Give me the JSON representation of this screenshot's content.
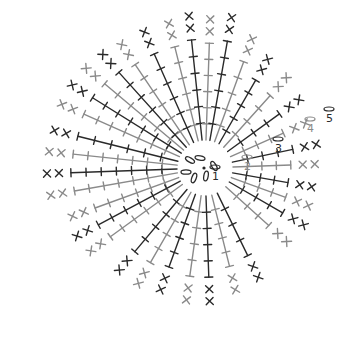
{
  "diagram": {
    "type": "crochet-chart",
    "colors": {
      "dark": "#2a2a2a",
      "light": "#8a8a8a",
      "background": "#ffffff"
    },
    "center": [
      205,
      168
    ],
    "round_labels": [
      {
        "text": "1",
        "x": 212,
        "y": 180,
        "color": "#2a2a2a"
      },
      {
        "text": "2",
        "x": 244,
        "y": 170,
        "color": "#8a8a8a"
      },
      {
        "text": "3",
        "x": 275,
        "y": 152,
        "color": "#2a2a2a"
      },
      {
        "text": "4",
        "x": 307,
        "y": 132,
        "color": "#8a8a8a"
      },
      {
        "text": "5",
        "x": 326,
        "y": 122,
        "color": "#2a2a2a"
      }
    ],
    "legend_symbols": [
      "chain-oval",
      "slip-stitch-dot",
      "single-crochet-cross",
      "double-crochet-T",
      "v-stitch"
    ],
    "spokes": [
      {
        "angle": 200,
        "len": 150,
        "tone": "light"
      },
      {
        "angle": 208,
        "len": 155,
        "tone": "dark"
      },
      {
        "angle": 216,
        "len": 150,
        "tone": "light"
      },
      {
        "angle": 190,
        "len": 170,
        "tone": "light"
      },
      {
        "angle": 182,
        "len": 172,
        "tone": "dark"
      },
      {
        "angle": 174,
        "len": 170,
        "tone": "light"
      },
      {
        "angle": 166,
        "len": 168,
        "tone": "dark"
      },
      {
        "angle": 156,
        "len": 170,
        "tone": "light"
      },
      {
        "angle": 148,
        "len": 170,
        "tone": "dark"
      },
      {
        "angle": 140,
        "len": 168,
        "tone": "light"
      },
      {
        "angle": 132,
        "len": 165,
        "tone": "dark"
      },
      {
        "angle": 124,
        "len": 160,
        "tone": "light"
      },
      {
        "angle": 114,
        "len": 160,
        "tone": "dark"
      },
      {
        "angle": 104,
        "len": 160,
        "tone": "light"
      },
      {
        "angle": 96,
        "len": 165,
        "tone": "dark"
      },
      {
        "angle": 88,
        "len": 160,
        "tone": "light"
      },
      {
        "angle": 80,
        "len": 165,
        "tone": "dark"
      },
      {
        "angle": 230,
        "len": 140,
        "tone": "dark"
      },
      {
        "angle": 240,
        "len": 140,
        "tone": "light"
      },
      {
        "angle": 250,
        "len": 135,
        "tone": "dark"
      },
      {
        "angle": 262,
        "len": 140,
        "tone": "light"
      },
      {
        "angle": 272,
        "len": 140,
        "tone": "dark"
      },
      {
        "angle": 284,
        "len": 130,
        "tone": "light"
      },
      {
        "angle": 296,
        "len": 125,
        "tone": "dark"
      },
      {
        "angle": 318,
        "len": 110,
        "tone": "light"
      },
      {
        "angle": 330,
        "len": 115,
        "tone": "dark"
      },
      {
        "angle": 340,
        "len": 110,
        "tone": "light"
      },
      {
        "angle": 350,
        "len": 108,
        "tone": "dark"
      },
      {
        "angle": 2,
        "len": 110,
        "tone": "light"
      },
      {
        "angle": 12,
        "len": 115,
        "tone": "dark"
      },
      {
        "angle": 24,
        "len": 110,
        "tone": "light"
      },
      {
        "angle": 36,
        "len": 118,
        "tone": "dark"
      },
      {
        "angle": 48,
        "len": 125,
        "tone": "light"
      },
      {
        "angle": 60,
        "len": 130,
        "tone": "dark"
      },
      {
        "angle": 70,
        "len": 145,
        "tone": "light"
      }
    ]
  }
}
